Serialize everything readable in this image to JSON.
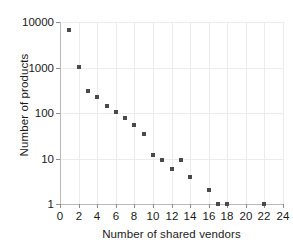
{
  "chart_data": {
    "type": "scatter",
    "title": "",
    "xlabel": "Number of shared vendors",
    "ylabel": "Number of products",
    "xlim": [
      0,
      24
    ],
    "ylim": [
      1,
      10000
    ],
    "yscale": "log",
    "xscale": "linear",
    "grid": true,
    "legend": null,
    "xticks": [
      0,
      2,
      4,
      6,
      8,
      10,
      12,
      14,
      16,
      18,
      20,
      22,
      24
    ],
    "xticklabels": [
      "0",
      "2",
      "4",
      "6",
      "8",
      "10",
      "12",
      "14",
      "16",
      "18",
      "20",
      "22",
      "24"
    ],
    "yticks": [
      1,
      10,
      100,
      1000,
      10000
    ],
    "yticklabels": [
      "1",
      "10",
      "100",
      "1000",
      "10000"
    ],
    "marker": "square",
    "marker_color": "#4a4a4a",
    "marker_size": 4,
    "x": [
      1,
      2,
      3,
      4,
      5,
      6,
      7,
      8,
      9,
      10,
      11,
      12,
      13,
      14,
      16,
      17,
      18,
      22
    ],
    "y": [
      6700,
      1050,
      300,
      220,
      140,
      105,
      78,
      56,
      35,
      12,
      9.5,
      6,
      9.5,
      4,
      2,
      1,
      1,
      1
    ],
    "points": [
      {
        "x": 1,
        "y": 6700
      },
      {
        "x": 2,
        "y": 1050
      },
      {
        "x": 3,
        "y": 300
      },
      {
        "x": 4,
        "y": 220
      },
      {
        "x": 5,
        "y": 140
      },
      {
        "x": 6,
        "y": 105
      },
      {
        "x": 7,
        "y": 78
      },
      {
        "x": 8,
        "y": 56
      },
      {
        "x": 9,
        "y": 35
      },
      {
        "x": 10,
        "y": 12
      },
      {
        "x": 11,
        "y": 9.5
      },
      {
        "x": 12,
        "y": 6
      },
      {
        "x": 13,
        "y": 9.5
      },
      {
        "x": 14,
        "y": 4
      },
      {
        "x": 16,
        "y": 2
      },
      {
        "x": 17,
        "y": 1
      },
      {
        "x": 18,
        "y": 1
      },
      {
        "x": 22,
        "y": 1
      }
    ]
  },
  "style": {
    "background": "#ffffff",
    "grid_color": "#ececec",
    "axis_color": "#b9b9b9",
    "text_color": "#1a1a1a"
  }
}
